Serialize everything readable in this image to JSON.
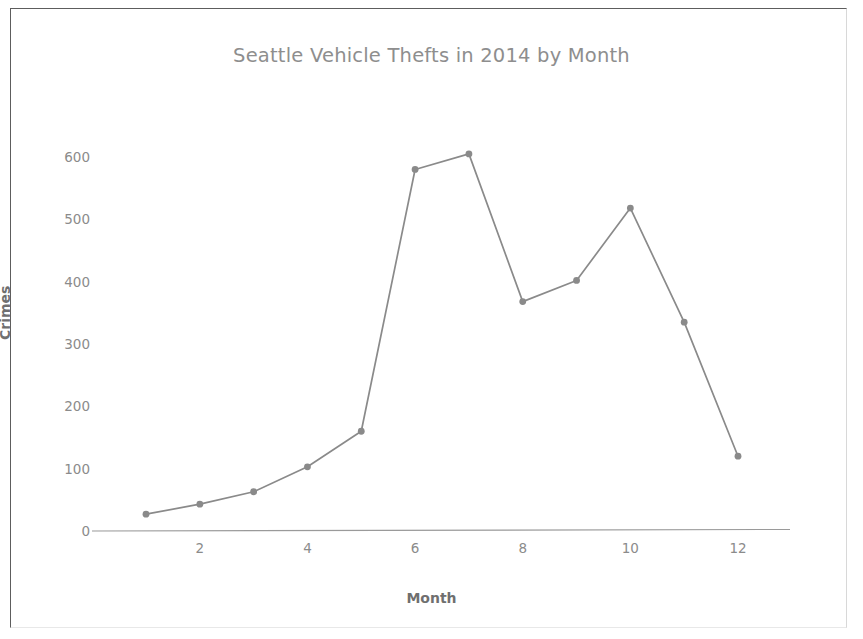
{
  "chart_data": {
    "type": "line",
    "title": "Seattle Vehicle Thefts in 2014 by Month",
    "xlabel": "Month",
    "ylabel": "Crimes",
    "x": [
      1,
      2,
      3,
      4,
      5,
      6,
      7,
      8,
      9,
      10,
      11,
      12
    ],
    "categories": [
      "1",
      "2",
      "3",
      "4",
      "5",
      "6",
      "7",
      "8",
      "9",
      "10",
      "11",
      "12"
    ],
    "values": [
      27,
      43,
      63,
      103,
      160,
      580,
      605,
      368,
      402,
      518,
      335,
      120
    ],
    "series": [
      {
        "name": "Crimes",
        "values": [
          27,
          43,
          63,
          103,
          160,
          580,
          605,
          368,
          402,
          518,
          335,
          120
        ]
      }
    ],
    "xlim": [
      0.6,
      12.6
    ],
    "ylim": [
      0,
      640
    ],
    "xticks": [
      2,
      4,
      6,
      8,
      10,
      12
    ],
    "xtick_labels": [
      "2",
      "4",
      "6",
      "8",
      "10",
      "12"
    ],
    "yticks": [
      0,
      100,
      200,
      300,
      400,
      500,
      600
    ],
    "ytick_labels": [
      "0",
      "100",
      "200",
      "300",
      "400",
      "500",
      "600"
    ],
    "grid": false,
    "legend": false,
    "marker": "circle",
    "line_color": "#8a8a8a",
    "marker_color": "#8a8a8a",
    "axis_color": "#9a9a9a",
    "title_color": "#8e8e8e",
    "tick_color": "#8b8b8b",
    "label_color": "#6f6f6f",
    "background_color": "#ffffff"
  }
}
